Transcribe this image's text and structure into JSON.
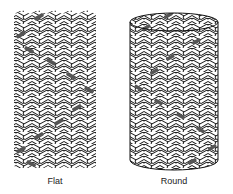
{
  "figures": [
    {
      "id": "flat",
      "label": "Flat"
    },
    {
      "id": "round",
      "label": "Round"
    }
  ],
  "colors": {
    "stroke": "#111111",
    "fill": "#ffffff",
    "tracer": "#555555"
  }
}
